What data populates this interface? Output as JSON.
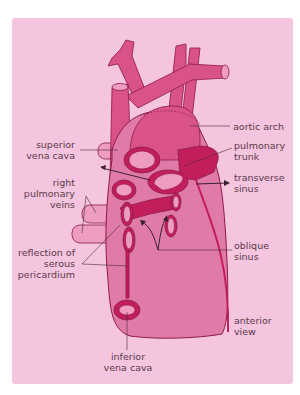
{
  "figure": {
    "colors": {
      "background": "#ffffff",
      "panel": "#f5c4df",
      "vessel": "#d9528a",
      "heart_body": "#e07aa8",
      "dark_accent": "#c21e5c",
      "outline": "#8c1a46",
      "light_vessel": "#ee9cc2",
      "label_text": "#5a3a48",
      "leader_line": "#4a2a38"
    },
    "labels": {
      "aortic_arch": [
        "aortic arch"
      ],
      "superior_vena_cava": [
        "superior",
        "vena cava"
      ],
      "pulmonary_trunk": [
        "pulmonary",
        "trunk"
      ],
      "transverse_sinus": [
        "transverse",
        "sinus"
      ],
      "right_pulmonary_veins": [
        "right",
        "pulmonary",
        "veins"
      ],
      "reflection_serous_pericardium": [
        "reflection of",
        "serous",
        "pericardium"
      ],
      "oblique_sinus": [
        "oblique",
        "sinus"
      ],
      "anterior_view": [
        "anterior",
        "view"
      ],
      "inferior_vena_cava": [
        "inferior",
        "vena cava"
      ]
    }
  }
}
